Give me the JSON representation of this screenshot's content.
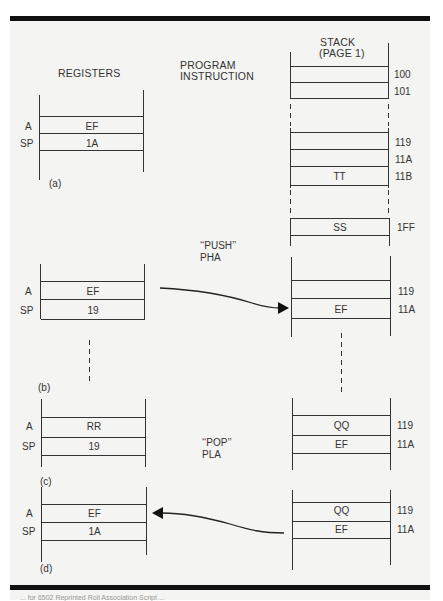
{
  "headers": {
    "registers": "REGISTERS",
    "program_instruction_line1": "PROGRAM",
    "program_instruction_line2": "INSTRUCTION",
    "stack_line1": "STACK",
    "stack_line2": "(PAGE 1)"
  },
  "register_labels": {
    "a": "A",
    "sp": "SP"
  },
  "panels": {
    "a": {
      "label": "(a)",
      "registers": {
        "a": "EF",
        "sp": "1A"
      },
      "stack": {
        "top_rows": [
          {
            "addr": "100",
            "value": ""
          },
          {
            "addr": "101",
            "value": ""
          }
        ],
        "mid_rows": [
          {
            "addr": "119",
            "value": ""
          },
          {
            "addr": "11A",
            "value": ""
          },
          {
            "addr": "11B",
            "value": "TT"
          }
        ],
        "bottom_rows": [
          {
            "addr": "1FF",
            "value": "SS"
          }
        ]
      }
    },
    "b": {
      "label": "(b)",
      "instruction_line1": "‘‘PUSH’’",
      "instruction_line2": "PHA",
      "registers": {
        "a": "EF",
        "sp": "19"
      },
      "stack": [
        {
          "addr": "119",
          "value": ""
        },
        {
          "addr": "11A",
          "value": "EF"
        }
      ]
    },
    "c": {
      "label": "(c)",
      "instruction_line1": "‘‘POP’’",
      "instruction_line2": "PLA",
      "registers": {
        "a": "RR",
        "sp": "19"
      },
      "stack": [
        {
          "addr": "119",
          "value": "QQ"
        },
        {
          "addr": "11A",
          "value": "EF"
        }
      ]
    },
    "d": {
      "label": "(d)",
      "registers": {
        "a": "EF",
        "sp": "1A"
      },
      "stack": [
        {
          "addr": "119",
          "value": "QQ"
        },
        {
          "addr": "11A",
          "value": "EF"
        }
      ]
    }
  },
  "caption": "... for 6502 Reprinted Roll Association Script ..."
}
